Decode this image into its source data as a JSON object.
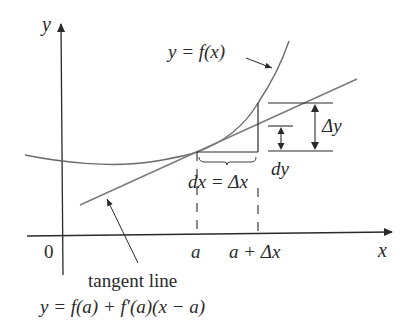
{
  "figure": {
    "axes": {
      "x_label": "x",
      "y_label": "y",
      "origin_label": "0"
    },
    "ticks": {
      "a": "a",
      "a_plus_dx": "a + Δx"
    },
    "curve_label": "y = f(x)",
    "tangent": {
      "label": "tangent line",
      "equation": "y = f(a) + f′(a)(x − a)"
    },
    "increments": {
      "dx_label": "dx = Δx",
      "dy_label": "dy",
      "delta_y_label": "Δy"
    },
    "colors": {
      "curve": "#6b6b6b",
      "tangent": "#7a7a7a",
      "axes": "#2a2a2a",
      "text": "#2a2a2a"
    }
  }
}
